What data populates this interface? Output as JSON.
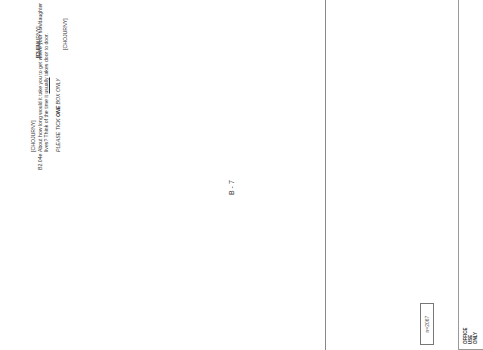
{
  "page": {
    "page_number": "B - 7",
    "office_use": [
      "OFFICE",
      "USE",
      "ONLY"
    ],
    "n_box": "n=2067"
  },
  "questions": [
    {
      "number": "B2.04e",
      "variable": "[CHOJURNY]",
      "text_line1": "About how long would it take you to get where your son/daughter",
      "text_line2_pre": "lives?  Think of the time it ",
      "text_line2_u": "usually",
      "text_line2_post": " takes door to door.",
      "instruction_pre": "PLEASE TICK ",
      "instruction_bold": "ONE",
      "instruction_post": " BOX ONLY",
      "pct_header": "%",
      "rows": [
        {
          "label": "Less than 15 minutes",
          "value": "10.5"
        },
        {
          "label": "Between 15 and 30 minutes",
          "value": "8.1"
        },
        {
          "label": "Between 30 minutes and 1 hour",
          "value": "4.6"
        },
        {
          "label": "Between 1 and 2 hours",
          "value": "2.8"
        },
        {
          "label": "Between 2 and 3 hours",
          "value": "2.0"
        },
        {
          "label": "Between 3 and 5 hours",
          "value": "1.7"
        },
        {
          "label": "Between 5 and 12 hours",
          "value": "1.2"
        },
        {
          "label": "Over 12 hours",
          "value": "0.5"
        },
        {
          "label": "(NA)",
          "value": "3.4"
        }
      ]
    },
    {
      "number": "e.",
      "variable": "[CHOPHONE]",
      "text_line1": "How often do you have any contact with this son/daughter",
      "text_line2_pre": "",
      "text_line2_u": "by telephone",
      "text_line2_post": "?",
      "instruction_pre": "PLEASE TICK ",
      "instruction_bold": "ONE",
      "instruction_post": " BOX ONLY",
      "pct_header": "%",
      "rows": [
        {
          "label": "Daily",
          "value": "3.6"
        },
        {
          "label": "At least several times a week",
          "value": "9.9"
        },
        {
          "label": "At least once a week",
          "value": "10.4"
        },
        {
          "label": "At least once a fortnight",
          "value": "2.5"
        },
        {
          "label": "At least once a month",
          "value": "1.6"
        },
        {
          "label": "Several times a year",
          "value": "1.4"
        },
        {
          "label": "Less often",
          "value": "0.5"
        },
        {
          "label": "Never",
          "value": "1.7"
        },
        {
          "label": "(NA)",
          "value": "3.2"
        }
      ]
    },
    {
      "number": "f.",
      "variable": "[CHOWRITE]",
      "text_line1": "And how often do you have any contact with this son/",
      "text_line2_pre": "daughter ",
      "text_line2_u": "by writing",
      "text_line2_post": "?",
      "instruction_pre": "PLEASE TICK ",
      "instruction_bold": "ONE",
      "instruction_post": " BOX ONLY",
      "pct_header": "%",
      "rows": [
        {
          "label": "Daily",
          "value": "-"
        },
        {
          "label": "At least several times a week",
          "value": "0.1"
        },
        {
          "label": "At least once a week",
          "value": "0.5"
        },
        {
          "label": "At least once a fortnight",
          "value": "0.6"
        },
        {
          "label": "At least once a month",
          "value": "1.0"
        },
        {
          "label": "Several times a year",
          "value": "3.5"
        },
        {
          "label": "Less often",
          "value": "6.6"
        },
        {
          "label": "Never",
          "value": "18.8"
        },
        {
          "label": "(NA)",
          "value": "3.6"
        }
      ]
    }
  ]
}
